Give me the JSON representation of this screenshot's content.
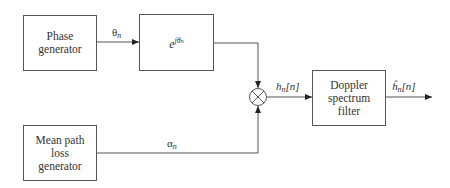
{
  "diagram": {
    "blocks": {
      "phase_generator": {
        "line1": "Phase",
        "line2": "generator"
      },
      "exponential": {
        "base": "e",
        "exponent": "jθ",
        "exponent_sub": "n"
      },
      "mean_path_loss": {
        "line1": "Mean path",
        "line2": "loss",
        "line3": "generator"
      },
      "doppler_filter": {
        "line1": "Doppler",
        "line2": "spectrum",
        "line3": "filter"
      }
    },
    "signals": {
      "theta": {
        "symbol": "θ",
        "sub": "n"
      },
      "alpha": {
        "symbol": "α",
        "sub": "n"
      },
      "h": {
        "symbol": "h",
        "sub": "n",
        "arg": "[n]"
      },
      "h_hat": {
        "symbol": "ĥ",
        "sub": "n",
        "arg": "[n]"
      }
    },
    "operators": {
      "multiplier": "⊗"
    }
  }
}
